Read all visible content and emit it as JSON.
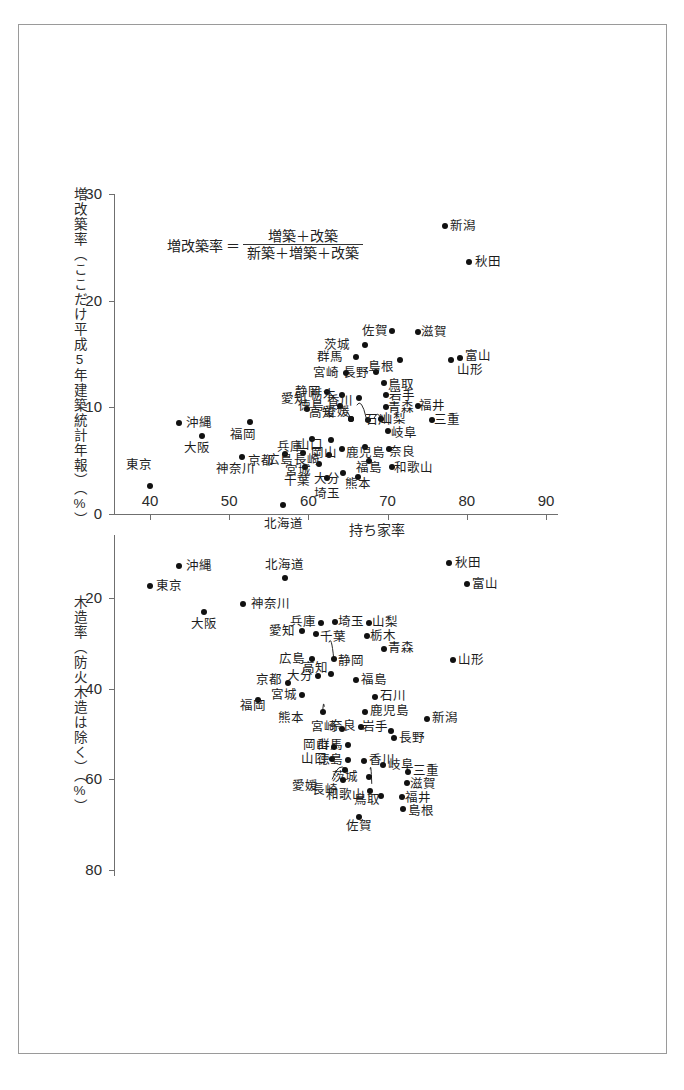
{
  "chart_data": [
    {
      "type": "scatter",
      "id": "upper",
      "title": "",
      "xlabel": "持ち家率",
      "ylabel": "増改築率（ここだけ平成5年建築統計年報）（%）",
      "xlim": [
        38,
        92
      ],
      "ylim": [
        0,
        30
      ],
      "xticks": [
        40,
        50,
        60,
        70,
        80,
        90
      ],
      "yticks": [
        0,
        10,
        20,
        30
      ],
      "grid": false,
      "legend": "none",
      "annotation": {
        "label": "増改築率",
        "equals": "＝",
        "numerator": "増築＋改築",
        "denominator": "新築＋増築＋改築"
      },
      "points": [
        {
          "name": "東京",
          "x": 40.0,
          "y": 2.6,
          "lx": 38.6,
          "ly": 4.6,
          "a": "c"
        },
        {
          "name": "沖縄",
          "x": 43.6,
          "y": 8.5,
          "lx": 44.6,
          "ly": 8.5,
          "a": "l"
        },
        {
          "name": "大阪",
          "x": 46.6,
          "y": 7.3,
          "lx": 45.9,
          "ly": 6.2,
          "a": "c"
        },
        {
          "name": "神奈川",
          "x": 51.6,
          "y": 5.3,
          "lx": 50.8,
          "ly": 4.2,
          "a": "c"
        },
        {
          "name": "北海道",
          "x": 56.8,
          "y": 0.8,
          "lx": 56.8,
          "ly": -0.9,
          "a": "c"
        },
        {
          "name": "福岡",
          "x": 52.6,
          "y": 8.6,
          "lx": 51.8,
          "ly": 7.4,
          "a": "c"
        },
        {
          "name": "京都",
          "x": 57.0,
          "y": 5.6,
          "lx": 55.6,
          "ly": 5.0,
          "a": "r"
        },
        {
          "name": "千葉",
          "x": 59.6,
          "y": 4.4,
          "lx": 58.6,
          "ly": 3.1,
          "a": "c"
        },
        {
          "name": "埼玉",
          "x": 62.3,
          "y": 3.4,
          "lx": 62.3,
          "ly": 1.9,
          "a": "c"
        },
        {
          "name": "愛知",
          "x": 59.8,
          "y": 9.8,
          "lx": 58.2,
          "ly": 10.8,
          "a": "c"
        },
        {
          "name": "兵庫",
          "x": 60.5,
          "y": 7.0,
          "lx": 59.3,
          "ly": 6.3,
          "a": "r"
        },
        {
          "name": "広島",
          "x": 59.3,
          "y": 5.7,
          "lx": 58.0,
          "ly": 5.1,
          "a": "r"
        },
        {
          "name": "宮城",
          "x": 61.4,
          "y": 4.7,
          "lx": 60.3,
          "ly": 4.0,
          "a": "r"
        },
        {
          "name": "長崎",
          "x": 62.6,
          "y": 5.5,
          "lx": 61.5,
          "ly": 5.1,
          "a": "r"
        },
        {
          "name": "山口",
          "x": 62.9,
          "y": 6.9,
          "lx": 61.9,
          "ly": 6.5,
          "a": "r"
        },
        {
          "name": "岡山",
          "x": 64.2,
          "y": 6.1,
          "lx": 63.6,
          "ly": 5.7,
          "a": "r"
        },
        {
          "name": "大分",
          "x": 64.4,
          "y": 3.8,
          "lx": 64.0,
          "ly": 3.3,
          "a": "r"
        },
        {
          "name": "静岡",
          "x": 62.4,
          "y": 11.4,
          "lx": 61.6,
          "ly": 11.4,
          "a": "r"
        },
        {
          "name": "栃木",
          "x": 64.2,
          "y": 11.2,
          "lx": 63.5,
          "ly": 11.2,
          "a": "r"
        },
        {
          "name": "徳島",
          "x": 64.0,
          "y": 10.1,
          "lx": 62.0,
          "ly": 10.1,
          "a": "r"
        },
        {
          "name": "高知",
          "x": 65.4,
          "y": 8.9,
          "lx": 63.3,
          "ly": 9.5,
          "a": "r"
        },
        {
          "name": "愛媛",
          "x": 65.4,
          "y": 8.9,
          "lx": 65.2,
          "ly": 9.6,
          "a": "r"
        },
        {
          "name": "香川",
          "x": 66.4,
          "y": 10.9,
          "lx": 65.6,
          "ly": 10.6,
          "a": "r"
        },
        {
          "name": "熊本",
          "x": 66.2,
          "y": 3.5,
          "lx": 66.2,
          "ly": 2.8,
          "a": "c"
        },
        {
          "name": "福島",
          "x": 67.7,
          "y": 5.0,
          "lx": 67.7,
          "ly": 4.3,
          "a": "c"
        },
        {
          "name": "鹿児島",
          "x": 67.2,
          "y": 6.3,
          "lx": 67.2,
          "ly": 5.7,
          "a": "c"
        },
        {
          "name": "石川",
          "x": 67.5,
          "y": 8.8,
          "lx": 67.2,
          "ly": 8.8,
          "a": "l"
        },
        {
          "name": "山梨",
          "x": 69.2,
          "y": 8.9,
          "lx": 69.1,
          "ly": 8.9,
          "a": "l"
        },
        {
          "name": "岐阜",
          "x": 70.0,
          "y": 7.8,
          "lx": 70.4,
          "ly": 7.6,
          "a": "l"
        },
        {
          "name": "奈良",
          "x": 70.2,
          "y": 6.1,
          "lx": 70.2,
          "ly": 5.8,
          "a": "l"
        },
        {
          "name": "和歌山",
          "x": 70.6,
          "y": 4.4,
          "lx": 70.8,
          "ly": 4.3,
          "a": "l"
        },
        {
          "name": "青森",
          "x": 69.8,
          "y": 10.0,
          "lx": 70.1,
          "ly": 9.9,
          "a": "l"
        },
        {
          "name": "岩手",
          "x": 69.8,
          "y": 11.2,
          "lx": 70.2,
          "ly": 11.1,
          "a": "l"
        },
        {
          "name": "福井",
          "x": 73.8,
          "y": 10.1,
          "lx": 74.0,
          "ly": 10.1,
          "a": "l"
        },
        {
          "name": "三重",
          "x": 75.6,
          "y": 8.8,
          "lx": 75.9,
          "ly": 8.8,
          "a": "l"
        },
        {
          "name": "鳥取",
          "x": 69.5,
          "y": 12.3,
          "lx": 70.0,
          "ly": 12.1,
          "a": "l"
        },
        {
          "name": "長野",
          "x": 68.5,
          "y": 13.3,
          "lx": 67.7,
          "ly": 13.2,
          "a": "r"
        },
        {
          "name": "宮崎",
          "x": 64.8,
          "y": 13.2,
          "lx": 63.9,
          "ly": 13.2,
          "a": "r"
        },
        {
          "name": "群馬",
          "x": 66.0,
          "y": 14.7,
          "lx": 64.4,
          "ly": 14.7,
          "a": "r"
        },
        {
          "name": "茨城",
          "x": 67.2,
          "y": 15.8,
          "lx": 65.2,
          "ly": 15.8,
          "a": "r"
        },
        {
          "name": "島根",
          "x": 71.6,
          "y": 14.4,
          "lx": 70.8,
          "ly": 13.8,
          "a": "r"
        },
        {
          "name": "佐賀",
          "x": 70.5,
          "y": 17.2,
          "lx": 70.0,
          "ly": 17.2,
          "a": "r"
        },
        {
          "name": "滋賀",
          "x": 73.8,
          "y": 17.1,
          "lx": 74.2,
          "ly": 17.1,
          "a": "l"
        },
        {
          "name": "富山",
          "x": 79.1,
          "y": 14.6,
          "lx": 79.8,
          "ly": 14.8,
          "a": "l"
        },
        {
          "name": "山形",
          "x": 78.0,
          "y": 14.4,
          "lx": 78.8,
          "ly": 13.5,
          "a": "l"
        },
        {
          "name": "新潟",
          "x": 77.2,
          "y": 27.0,
          "lx": 77.9,
          "ly": 27.0,
          "a": "l"
        },
        {
          "name": "秋田",
          "x": 80.3,
          "y": 23.6,
          "lx": 81.0,
          "ly": 23.6,
          "a": "l"
        }
      ],
      "leaders": [
        {
          "from": [
            63.5,
            9.8
          ],
          "to": [
            65.4,
            8.9
          ]
        },
        {
          "from": [
            66.1,
            10.2
          ],
          "to": [
            67.3,
            9.0
          ]
        },
        {
          "from": [
            68.3,
            9.0
          ],
          "to": [
            69.2,
            8.9
          ]
        }
      ]
    },
    {
      "type": "scatter",
      "id": "lower",
      "title": "",
      "xlabel": "",
      "ylabel": "木造率（防火木造は除く）（%）",
      "xlim": [
        38,
        92
      ],
      "ylim": [
        80,
        8
      ],
      "yticks": [
        20,
        40,
        60,
        80
      ],
      "grid": false,
      "legend": "none",
      "points": [
        {
          "name": "沖縄",
          "x": 43.6,
          "y": 13.0,
          "lx": 44.6,
          "ly": 13.0,
          "a": "l"
        },
        {
          "name": "北海道",
          "x": 57.0,
          "y": 15.6,
          "lx": 57.0,
          "ly": 12.8,
          "a": "c"
        },
        {
          "name": "東京",
          "x": 40.0,
          "y": 17.4,
          "lx": 40.8,
          "ly": 17.4,
          "a": "l"
        },
        {
          "name": "神奈川",
          "x": 51.8,
          "y": 21.4,
          "lx": 52.7,
          "ly": 21.4,
          "a": "l"
        },
        {
          "name": "大阪",
          "x": 46.8,
          "y": 23.0,
          "lx": 46.8,
          "ly": 25.8,
          "a": "c"
        },
        {
          "name": "愛知",
          "x": 59.2,
          "y": 27.2,
          "lx": 58.3,
          "ly": 27.2,
          "a": "r"
        },
        {
          "name": "兵庫",
          "x": 61.6,
          "y": 25.6,
          "lx": 60.9,
          "ly": 25.2,
          "a": "r"
        },
        {
          "name": "埼玉",
          "x": 63.4,
          "y": 25.4,
          "lx": 63.8,
          "ly": 25.2,
          "a": "l"
        },
        {
          "name": "千葉",
          "x": 61.0,
          "y": 28.0,
          "lx": 61.5,
          "ly": 28.6,
          "a": "l"
        },
        {
          "name": "山梨",
          "x": 67.6,
          "y": 25.6,
          "lx": 68.0,
          "ly": 25.4,
          "a": "l"
        },
        {
          "name": "栃木",
          "x": 67.4,
          "y": 28.4,
          "lx": 67.8,
          "ly": 28.4,
          "a": "l"
        },
        {
          "name": "青森",
          "x": 69.6,
          "y": 31.2,
          "lx": 70.0,
          "ly": 31.0,
          "a": "l"
        },
        {
          "name": "山形",
          "x": 78.2,
          "y": 33.6,
          "lx": 78.9,
          "ly": 33.6,
          "a": "l"
        },
        {
          "name": "広島",
          "x": 60.4,
          "y": 33.4,
          "lx": 59.6,
          "ly": 33.4,
          "a": "r"
        },
        {
          "name": "静岡",
          "x": 63.2,
          "y": 33.4,
          "lx": 63.8,
          "ly": 33.8,
          "a": "l"
        },
        {
          "name": "高知",
          "x": 62.8,
          "y": 36.8,
          "lx": 62.5,
          "ly": 35.4,
          "a": "r"
        },
        {
          "name": "大分",
          "x": 61.2,
          "y": 37.2,
          "lx": 60.6,
          "ly": 37.2,
          "a": "r"
        },
        {
          "name": "京都",
          "x": 57.4,
          "y": 38.8,
          "lx": 56.7,
          "ly": 38.0,
          "a": "r"
        },
        {
          "name": "宮城",
          "x": 59.2,
          "y": 41.4,
          "lx": 58.6,
          "ly": 41.4,
          "a": "r"
        },
        {
          "name": "福岡",
          "x": 53.6,
          "y": 42.6,
          "lx": 53.0,
          "ly": 43.8,
          "a": "c"
        },
        {
          "name": "福島",
          "x": 66.0,
          "y": 38.0,
          "lx": 66.6,
          "ly": 38.0,
          "a": "l"
        },
        {
          "name": "石川",
          "x": 68.4,
          "y": 41.8,
          "lx": 69.0,
          "ly": 41.6,
          "a": "l"
        },
        {
          "name": "熊本",
          "x": 61.8,
          "y": 45.2,
          "lx": 59.4,
          "ly": 46.4,
          "a": "r"
        },
        {
          "name": "鹿児島",
          "x": 67.2,
          "y": 45.2,
          "lx": 67.8,
          "ly": 45.0,
          "a": "l"
        },
        {
          "name": "新潟",
          "x": 75.0,
          "y": 46.6,
          "lx": 75.6,
          "ly": 46.4,
          "a": "l"
        },
        {
          "name": "宮崎",
          "x": 64.2,
          "y": 48.8,
          "lx": 63.6,
          "ly": 48.4,
          "a": "r"
        },
        {
          "name": "奈良",
          "x": 66.6,
          "y": 48.4,
          "lx": 66.0,
          "ly": 48.2,
          "a": "r"
        },
        {
          "name": "岩手",
          "x": 70.4,
          "y": 49.4,
          "lx": 70.0,
          "ly": 48.4,
          "a": "r"
        },
        {
          "name": "長野",
          "x": 70.8,
          "y": 50.8,
          "lx": 71.4,
          "ly": 50.8,
          "a": "l"
        },
        {
          "name": "群馬",
          "x": 65.0,
          "y": 52.4,
          "lx": 64.4,
          "ly": 52.4,
          "a": "r"
        },
        {
          "name": "岡山",
          "x": 63.2,
          "y": 52.8,
          "lx": 62.6,
          "ly": 52.4,
          "a": "r"
        },
        {
          "name": "山口",
          "x": 63.0,
          "y": 55.6,
          "lx": 62.4,
          "ly": 55.6,
          "a": "r"
        },
        {
          "name": "徳島",
          "x": 65.0,
          "y": 55.8,
          "lx": 64.4,
          "ly": 55.8,
          "a": "r"
        },
        {
          "name": "香川",
          "x": 67.0,
          "y": 56.0,
          "lx": 67.6,
          "ly": 55.8,
          "a": "l"
        },
        {
          "name": "岐阜",
          "x": 69.4,
          "y": 56.8,
          "lx": 70.0,
          "ly": 56.8,
          "a": "l"
        },
        {
          "name": "三重",
          "x": 72.6,
          "y": 58.4,
          "lx": 73.2,
          "ly": 58.2,
          "a": "l"
        },
        {
          "name": "茨城",
          "x": 67.6,
          "y": 59.4,
          "lx": 66.2,
          "ly": 59.4,
          "a": "r"
        },
        {
          "name": "滋賀",
          "x": 72.4,
          "y": 60.8,
          "lx": 72.8,
          "ly": 61.0,
          "a": "l"
        },
        {
          "name": "愛媛",
          "x": 64.6,
          "y": 58.0,
          "lx": 61.2,
          "ly": 61.4,
          "a": "r"
        },
        {
          "name": "長崎",
          "x": 64.4,
          "y": 60.2,
          "lx": 63.7,
          "ly": 62.4,
          "a": "r"
        },
        {
          "name": "和歌山",
          "x": 67.8,
          "y": 62.6,
          "lx": 67.2,
          "ly": 63.4,
          "a": "r"
        },
        {
          "name": "鳥取",
          "x": 69.2,
          "y": 63.6,
          "lx": 69.0,
          "ly": 64.6,
          "a": "r"
        },
        {
          "name": "福井",
          "x": 71.8,
          "y": 63.8,
          "lx": 72.2,
          "ly": 64.2,
          "a": "l"
        },
        {
          "name": "島根",
          "x": 72.0,
          "y": 66.6,
          "lx": 72.6,
          "ly": 67.0,
          "a": "l"
        },
        {
          "name": "佐賀",
          "x": 66.4,
          "y": 68.4,
          "lx": 66.4,
          "ly": 70.4,
          "a": "c"
        },
        {
          "name": "秋田",
          "x": 77.8,
          "y": 12.2,
          "lx": 78.5,
          "ly": 12.2,
          "a": "l"
        },
        {
          "name": "富山",
          "x": 80.0,
          "y": 17.0,
          "lx": 80.7,
          "ly": 17.0,
          "a": "l"
        }
      ],
      "leaders": [
        {
          "from": [
            62.6,
            29.8
          ],
          "to": [
            63.2,
            33.4
          ]
        },
        {
          "from": [
            62.0,
            44.0
          ],
          "to": [
            61.8,
            45.2
          ]
        },
        {
          "from": [
            63.0,
            60.0
          ],
          "to": [
            64.7,
            57.8
          ]
        },
        {
          "from": [
            68.0,
            61.0
          ],
          "to": [
            67.8,
            57.8
          ]
        }
      ]
    }
  ]
}
